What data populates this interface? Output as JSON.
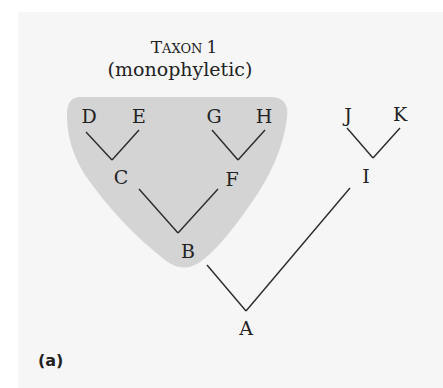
{
  "figure": {
    "panel_label": "(a)",
    "taxon": {
      "title_big": "T",
      "title_small": "AXON",
      "title_num": "1",
      "subtitle": "(monophyletic)",
      "shade_color": "#d4d4d4",
      "members": [
        "B",
        "C",
        "D",
        "E",
        "F",
        "G",
        "H"
      ]
    },
    "nodes": {
      "A": "A",
      "B": "B",
      "C": "C",
      "D": "D",
      "E": "E",
      "F": "F",
      "G": "G",
      "H": "H",
      "I": "I",
      "J": "J",
      "K": "K"
    },
    "tree": {
      "root": "A",
      "edges": [
        [
          "A",
          "B"
        ],
        [
          "A",
          "I"
        ],
        [
          "B",
          "C"
        ],
        [
          "B",
          "F"
        ],
        [
          "C",
          "D"
        ],
        [
          "C",
          "E"
        ],
        [
          "F",
          "G"
        ],
        [
          "F",
          "H"
        ],
        [
          "I",
          "J"
        ],
        [
          "I",
          "K"
        ]
      ]
    },
    "colors": {
      "background": "#f6f6f6",
      "line": "#2a2a2a",
      "text": "#222222"
    }
  }
}
